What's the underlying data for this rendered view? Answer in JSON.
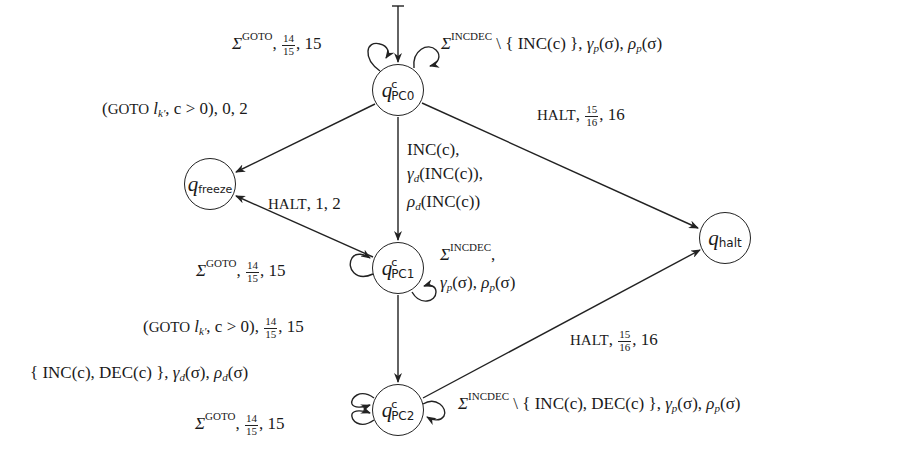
{
  "diagram": {
    "type": "state-machine",
    "nodes": [
      {
        "id": "pc0",
        "symbol": "q",
        "subscript": "PC0",
        "superscript": "c",
        "initial": true
      },
      {
        "id": "freeze",
        "symbol": "q",
        "subscript": "freeze"
      },
      {
        "id": "halt",
        "symbol": "q",
        "subscript": "halt"
      },
      {
        "id": "pc1",
        "symbol": "q",
        "subscript": "PC1",
        "superscript": "c"
      },
      {
        "id": "pc2",
        "symbol": "q",
        "subscript": "PC2",
        "superscript": "c"
      }
    ],
    "edges": {
      "pc0_self_left": {
        "sigma": "Σ",
        "sup": "GOTO",
        "num": "14",
        "den": "15",
        "tail": ", 15"
      },
      "pc0_self_right": {
        "sigma": "Σ",
        "sup": "INCDEC",
        "set": " \\ { INC(c) }",
        "gamma": "γ",
        "gsub": "p",
        "garg": "(σ)",
        "rho": "ρ",
        "rsub": "p",
        "rarg": "(σ)"
      },
      "pc0_to_freeze": {
        "pre": "(",
        "cmd": "GOTO",
        "l": "l",
        "lsub": "k′",
        "cond": ", c > 0), 0, 2"
      },
      "pc0_to_halt": {
        "cmd": "HALT",
        "num": "15",
        "den": "16",
        "tail": ", 16"
      },
      "pc0_to_pc1": {
        "line1": "INC(c),",
        "line2_sym": "γ",
        "line2_sub": "d",
        "line2_arg": "(INC(c)),",
        "line3_sym": "ρ",
        "line3_sub": "d",
        "line3_arg": "(INC(c))"
      },
      "pc1_to_freeze": {
        "cmd": "HALT",
        "tail": ", 1, 2"
      },
      "pc1_self_left": {
        "sigma": "Σ",
        "sup": "GOTO",
        "num": "14",
        "den": "15",
        "tail": ", 15"
      },
      "pc1_self_right": {
        "sigma": "Σ",
        "sup": "INCDEC",
        "tail1": ",",
        "gamma": "γ",
        "gsub": "p",
        "garg": "(σ)",
        "rho": "ρ",
        "rsub": "p",
        "rarg": "(σ)"
      },
      "pc1_to_pc2": {
        "pre": "(",
        "cmd": "GOTO",
        "l": "l",
        "lsub": "k′",
        "cond": ", c > 0), ",
        "num": "14",
        "den": "15",
        "tail": ", 15"
      },
      "pc2_to_halt": {
        "cmd": "HALT",
        "num": "15",
        "den": "16",
        "tail": ", 16"
      },
      "pc2_self_left_top": {
        "set": "{ INC(c), DEC(c) }",
        "gamma": "γ",
        "gsub": "d",
        "garg": "(σ)",
        "rho": "ρ",
        "rsub": "d",
        "rarg": "(σ)"
      },
      "pc2_self_left_bottom": {
        "sigma": "Σ",
        "sup": "GOTO",
        "num": "14",
        "den": "15",
        "tail": ", 15"
      },
      "pc2_self_right": {
        "sigma": "Σ",
        "sup": "INCDEC",
        "set": " \\ { INC(c), DEC(c) }",
        "gamma": "γ",
        "gsub": "p",
        "garg": "(σ)",
        "rho": "ρ",
        "rsub": "p",
        "rarg": "(σ)"
      }
    }
  }
}
